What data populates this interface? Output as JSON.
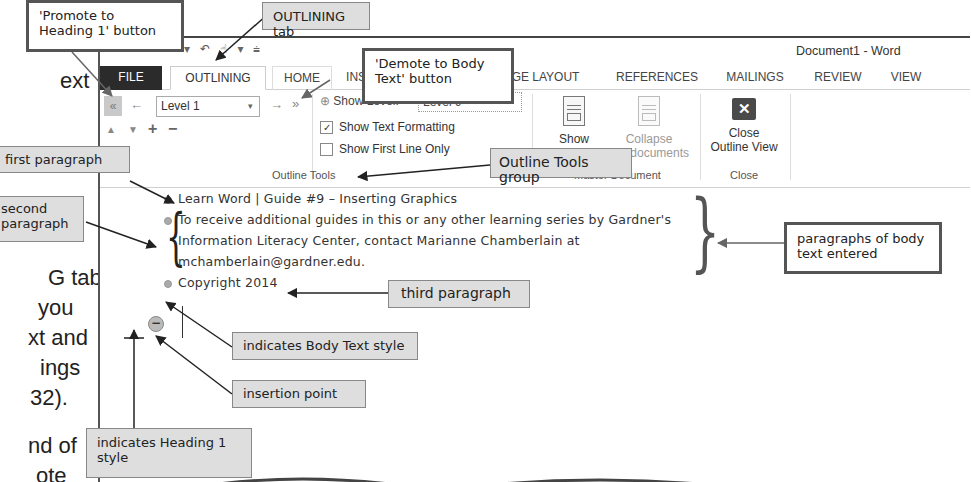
{
  "margin_text": {
    "lines": [
      "k",
      "ext",
      "first paragraph",
      "econd",
      "paragraph",
      "G tab |",
      "you",
      "xt and",
      "ings",
      "32).",
      "nd of",
      "ote"
    ]
  },
  "window": {
    "title": "Document1 - Word",
    "quick_access": [
      "save-icon",
      "undo-icon",
      "redo-icon",
      "touch-mode-icon",
      "customize-qat-icon"
    ]
  },
  "tabs": [
    {
      "label": "FILE"
    },
    {
      "label": "OUTLINING",
      "active": true
    },
    {
      "label": "HOME"
    },
    {
      "label": "INSERT"
    },
    {
      "label": "DESIGN"
    },
    {
      "label": "PAGE LAYOUT"
    },
    {
      "label": "REFERENCES"
    },
    {
      "label": "MAILINGS"
    },
    {
      "label": "REVIEW"
    },
    {
      "label": "VIEW"
    }
  ],
  "ribbon": {
    "outline_tools": {
      "promote_to_heading1_icon": "«",
      "promote_icon": "←",
      "level_value": "Level 1",
      "demote_icon": "→",
      "demote_to_body_icon": "»",
      "move_up_icon": "▲",
      "move_down_icon": "▼",
      "expand_icon": "+",
      "collapse_icon": "−",
      "show_level_label": "Show Level:",
      "show_level_value": "Level 9",
      "show_text_formatting": {
        "label": "Show Text Formatting",
        "checked": true
      },
      "show_first_line_only": {
        "label": "Show First Line Only",
        "checked": false
      },
      "group_label": "Outline Tools"
    },
    "master_document": {
      "show_document": "Show",
      "show_document_line2": "Document",
      "collapse_subdocuments": "Collapse",
      "collapse_subdocuments_line2": "Subdocuments",
      "group_label": "Master Document"
    },
    "close": {
      "close_outline_view_line1": "Close",
      "close_outline_view_line2": "Outline View",
      "group_label": "Close"
    }
  },
  "document": {
    "paragraphs": [
      {
        "text": "Learn Word | Guide #9 – Inserting Graphics"
      },
      {
        "lines": [
          "To receive additional guides in this or any other learning series by Gardner's",
          "Information Literacy Center, contact Marianne Chamberlain at",
          "mchamberlain@gardner.edu."
        ]
      },
      {
        "text": "Copyright 2014"
      }
    ]
  },
  "callouts": {
    "promote_heading1": "'Promote to Heading 1' button",
    "outlining_tab": "OUTLINING tab",
    "demote_body": "'Demote to Body Text' button",
    "outline_tools_group": "Outline Tools group",
    "first_paragraph": "first paragraph",
    "second_paragraph_1": "second",
    "second_paragraph_2": "paragraph",
    "third_paragraph": "third paragraph",
    "body_text_entered": "paragraphs of body text entered",
    "body_text_style": "indicates Body Text style",
    "insertion_point": "insertion point",
    "heading1_style": "indicates Heading 1 style"
  },
  "colors": {
    "file_tab_bg": "#2b2b2b",
    "callout_grey": "#dedede",
    "callout_border": "#555555"
  }
}
